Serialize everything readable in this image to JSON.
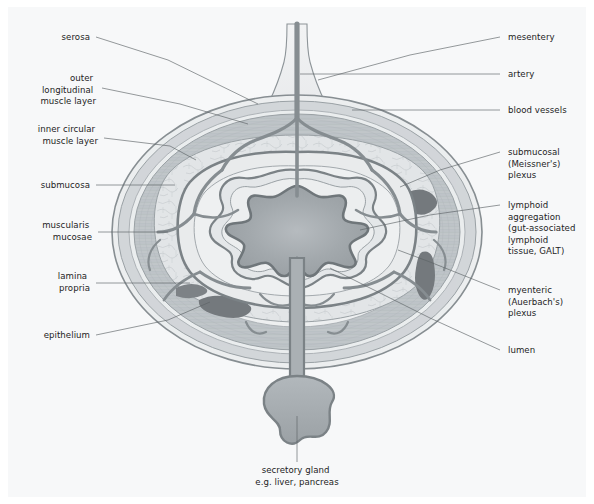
{
  "figure": {
    "background_color": "#f7f8f9",
    "text_color": "#1d1d1d",
    "leader_color": "#5d6366"
  },
  "palette": {
    "serosa_outline": "#7c8488",
    "serosa_fill": "#e8eaec",
    "longitudinal_muscle": "#c9cdd0",
    "circular_muscle": "#bfc4c8",
    "submucosa": "#dfe2e4",
    "muscularis_mucosae": "#8d9498",
    "lamina_propria": "#e6e8ea",
    "epithelium": "#7c8488",
    "lumen": "#9aa0a4",
    "vessel": "#8a9195",
    "lymphoid": "#6f767a",
    "gland": "#a3a9ad"
  },
  "labels": {
    "left": [
      {
        "id": "serosa",
        "lines": [
          "serosa"
        ]
      },
      {
        "id": "outer-longitudinal-muscle-layer",
        "lines": [
          "outer",
          "longitudinal",
          "muscle layer"
        ]
      },
      {
        "id": "inner-circular-muscle-layer",
        "lines": [
          "inner circular",
          "muscle layer"
        ]
      },
      {
        "id": "submucosa",
        "lines": [
          "submucosa"
        ]
      },
      {
        "id": "muscularis-mucosae",
        "lines": [
          "muscularis",
          "mucosae"
        ]
      },
      {
        "id": "lamina-propria",
        "lines": [
          "lamina",
          "propria"
        ]
      },
      {
        "id": "epithelium",
        "lines": [
          "epithelium"
        ]
      }
    ],
    "right": [
      {
        "id": "mesentery",
        "lines": [
          "mesentery"
        ]
      },
      {
        "id": "artery",
        "lines": [
          "artery"
        ]
      },
      {
        "id": "blood-vessels",
        "lines": [
          "blood vessels"
        ]
      },
      {
        "id": "submucosal-meissners-plexus",
        "lines": [
          "submucosal",
          "(Meissner's)",
          "plexus"
        ]
      },
      {
        "id": "lymphoid-aggregation",
        "lines": [
          "lymphoid",
          "aggregation",
          "(gut-associated",
          "lymphoid",
          "tissue, GALT)"
        ]
      },
      {
        "id": "myenteric-auerbachs-plexus",
        "lines": [
          "myenteric",
          "(Auerbach's)",
          "plexus"
        ]
      },
      {
        "id": "lumen",
        "lines": [
          "lumen"
        ]
      }
    ],
    "bottom": [
      {
        "id": "secretory-gland",
        "lines": [
          "secretory gland",
          "e.g. liver, pancreas"
        ]
      }
    ]
  }
}
